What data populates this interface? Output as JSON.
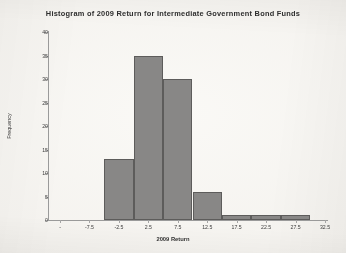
{
  "chart_data": {
    "type": "bar",
    "title": "Histogram of 2009 Return for Intermediate Government Bond Funds",
    "xlabel": "2009 Return",
    "ylabel": "Frequency",
    "xlim": [
      -12.5,
      32.5
    ],
    "ylim": [
      0,
      40
    ],
    "grid": false,
    "legend": null,
    "bin_width": 5,
    "x_tick_labels": [
      "-",
      "-7.5",
      "-2.5",
      "2.5",
      "7.5",
      "12.5",
      "17.5",
      "22.5",
      "27.5",
      "32.5"
    ],
    "x_tick_values": [
      -12.5,
      -7.5,
      -2.5,
      2.5,
      7.5,
      12.5,
      17.5,
      22.5,
      27.5,
      32.5
    ],
    "y_tick_labels": [
      "0",
      "5",
      "10",
      "15",
      "20",
      "25",
      "30",
      "35",
      "40"
    ],
    "y_tick_values": [
      0,
      5,
      10,
      15,
      20,
      25,
      30,
      35,
      40
    ],
    "bins": [
      {
        "left": -5.0,
        "right": 0.0,
        "center": -2.5,
        "value": 13
      },
      {
        "left": 0.0,
        "right": 5.0,
        "center": 2.5,
        "value": 35
      },
      {
        "left": 5.0,
        "right": 10.0,
        "center": 7.5,
        "value": 30
      },
      {
        "left": 10.0,
        "right": 15.0,
        "center": 12.5,
        "value": 6
      },
      {
        "left": 15.0,
        "right": 20.0,
        "center": 17.5,
        "value": 1
      },
      {
        "left": 20.0,
        "right": 25.0,
        "center": 22.5,
        "value": 1
      },
      {
        "left": 25.0,
        "right": 30.0,
        "center": 27.5,
        "value": 1
      }
    ],
    "categories": [
      "-2.5",
      "2.5",
      "7.5",
      "12.5",
      "17.5",
      "22.5",
      "27.5"
    ],
    "values": [
      13,
      35,
      30,
      6,
      1,
      1,
      1
    ],
    "bar_fill_color": "#888786",
    "bar_edge_color": "#5d5c5b",
    "axis_color": "#9a9a9a",
    "text_color": "#303030",
    "background_color": "#f7f5f1"
  }
}
